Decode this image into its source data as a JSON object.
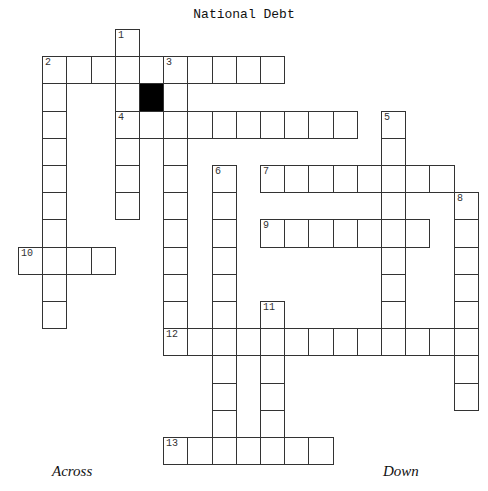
{
  "title": "National Debt",
  "headings": {
    "across": "Across",
    "down": "Down"
  },
  "grid": {
    "origin_x": 18,
    "origin_y": 29,
    "cell_w": 24.2,
    "cell_h": 27.2,
    "entries": [
      {
        "number": "1",
        "dir": "down",
        "col": 4,
        "row": 0,
        "len": 7
      },
      {
        "number": "2",
        "dir": "across",
        "col": 1,
        "row": 1,
        "len": 10
      },
      {
        "number": "2",
        "dir": "down",
        "col": 1,
        "row": 1,
        "len": 10
      },
      {
        "number": "3",
        "dir": "down",
        "col": 6,
        "row": 1,
        "len": 11
      },
      {
        "number": "4",
        "dir": "across",
        "col": 4,
        "row": 3,
        "len": 10
      },
      {
        "number": "5",
        "dir": "down",
        "col": 15,
        "row": 3,
        "len": 9
      },
      {
        "number": "6",
        "dir": "down",
        "col": 8,
        "row": 5,
        "len": 10
      },
      {
        "number": "7",
        "dir": "across",
        "col": 10,
        "row": 5,
        "len": 8
      },
      {
        "number": "8",
        "dir": "down",
        "col": 18,
        "row": 6,
        "len": 8
      },
      {
        "number": "9",
        "dir": "across",
        "col": 10,
        "row": 7,
        "len": 7
      },
      {
        "number": "10",
        "dir": "across",
        "col": 0,
        "row": 8,
        "len": 4
      },
      {
        "number": "11",
        "dir": "down",
        "col": 10,
        "row": 10,
        "len": 6
      },
      {
        "number": "12",
        "dir": "across",
        "col": 6,
        "row": 11,
        "len": 13
      },
      {
        "number": "13",
        "dir": "across",
        "col": 6,
        "row": 15,
        "len": 7
      }
    ],
    "black_cells": [
      {
        "col": 5,
        "row": 2
      }
    ]
  }
}
